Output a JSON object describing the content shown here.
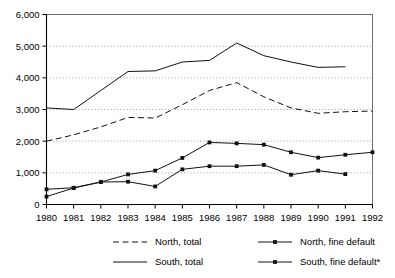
{
  "chart_data": {
    "type": "line",
    "title": "",
    "xlabel": "",
    "ylabel": "",
    "x": [
      1980,
      1981,
      1982,
      1983,
      1984,
      1985,
      1986,
      1987,
      1988,
      1989,
      1990,
      1991,
      1992
    ],
    "categories": [
      "1980",
      "1981",
      "1982",
      "1983",
      "1984",
      "1985",
      "1986",
      "1987",
      "1988",
      "1989",
      "1990",
      "1991",
      "1992"
    ],
    "xlim": [
      1980,
      1992
    ],
    "ylim": [
      0,
      6000
    ],
    "ytick_values": [
      0,
      1000,
      2000,
      3000,
      4000,
      5000,
      6000
    ],
    "ytick_labels": [
      "0",
      "1,000",
      "2,000",
      "3,000",
      "4,000",
      "5,000",
      "6,000"
    ],
    "grid": "horizontal-dotted",
    "legend_position": "bottom",
    "series": [
      {
        "name": "North, total",
        "style": "dashed",
        "marker": "none",
        "x": [
          1980,
          1981,
          1982,
          1983,
          1984,
          1985,
          1986,
          1987,
          1988,
          1989,
          1990,
          1991,
          1992
        ],
        "values": [
          2000,
          2200,
          2450,
          2750,
          2730,
          3150,
          3600,
          3850,
          3400,
          3050,
          2880,
          2930,
          2950
        ]
      },
      {
        "name": "South, total",
        "style": "solid",
        "marker": "none",
        "x": [
          1980,
          1981,
          1982,
          1983,
          1984,
          1985,
          1986,
          1987,
          1988,
          1989,
          1990,
          1991
        ],
        "values": [
          3050,
          3000,
          3600,
          4200,
          4220,
          4500,
          4550,
          5100,
          4700,
          4500,
          4330,
          4350
        ]
      },
      {
        "name": "North, fine default",
        "style": "solid",
        "marker": "square",
        "x": [
          1980,
          1981,
          1982,
          1983,
          1984,
          1985,
          1986,
          1987,
          1988,
          1989,
          1990,
          1991,
          1992
        ],
        "values": [
          250,
          520,
          710,
          950,
          1070,
          1470,
          1960,
          1930,
          1890,
          1650,
          1480,
          1570,
          1650
        ]
      },
      {
        "name": "South, fine default*",
        "style": "solid",
        "marker": "square",
        "x": [
          1980,
          1981,
          1982,
          1983,
          1984,
          1985,
          1986,
          1987,
          1988,
          1989,
          1990,
          1991
        ],
        "values": [
          480,
          530,
          710,
          720,
          570,
          1110,
          1210,
          1210,
          1250,
          940,
          1070,
          960
        ]
      }
    ]
  },
  "legend": {
    "entries": [
      {
        "label": "North, total",
        "style": "dashed",
        "marker": "none"
      },
      {
        "label": "North, fine default",
        "style": "solid",
        "marker": "square"
      },
      {
        "label": "South, total",
        "style": "solid",
        "marker": "none"
      },
      {
        "label": "South, fine default*",
        "style": "solid",
        "marker": "square"
      }
    ]
  },
  "colors": {
    "ink": "#111111",
    "grid": "#8c8c8c",
    "frame": "#6e6e6e",
    "background": "#ffffff"
  }
}
